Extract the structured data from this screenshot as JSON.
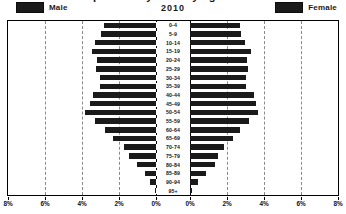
{
  "title": "Population Pyramid by Age and Sex",
  "year": "2010",
  "legend": {
    "male": "Male",
    "female": "Female",
    "swatch_color": "#1a1a1a"
  },
  "axis": {
    "x_ticks": [
      "8%",
      "6%",
      "4%",
      "2%",
      "0%",
      "0%",
      "2%",
      "4%",
      "6%",
      "8%"
    ],
    "max_percent": 8
  },
  "chart_data": {
    "type": "bar",
    "subtype": "population-pyramid",
    "title": "Population Pyramid by Age and Sex",
    "subtitle": "2010",
    "xlabel": "",
    "ylabel": "",
    "xlim": [
      0,
      8
    ],
    "grid": true,
    "legend_position": "top",
    "orientation": "horizontal-mirrored",
    "categories": [
      "95+",
      "90-94",
      "85-89",
      "80-84",
      "75-79",
      "70-74",
      "65-69",
      "60-64",
      "55-59",
      "50-54",
      "45-49",
      "40-44",
      "35-39",
      "30-34",
      "25-29",
      "20-24",
      "15-19",
      "10-14",
      "5-9",
      "0-4"
    ],
    "series": [
      {
        "name": "Male",
        "side": "left",
        "color": "#1a1a1a",
        "values": [
          0.07,
          0.3,
          0.62,
          1.05,
          1.45,
          1.75,
          2.3,
          2.75,
          3.3,
          3.85,
          3.55,
          3.4,
          3.05,
          3.05,
          3.25,
          3.2,
          3.45,
          3.3,
          2.95,
          2.8
        ]
      },
      {
        "name": "Female",
        "side": "right",
        "color": "#1a1a1a",
        "values": [
          0.1,
          0.42,
          0.88,
          1.35,
          1.5,
          1.85,
          2.35,
          2.7,
          3.2,
          3.7,
          3.55,
          3.45,
          3.05,
          3.0,
          3.15,
          3.1,
          3.3,
          2.95,
          2.75,
          2.7
        ]
      }
    ]
  }
}
